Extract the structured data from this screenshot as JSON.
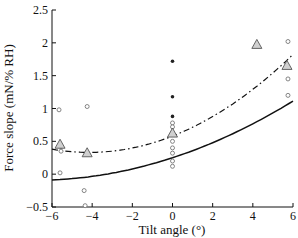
{
  "chart_data": {
    "type": "scatter",
    "title": "",
    "xlabel": "Tilt angle (°)",
    "ylabel": "Force slope (mN/% RH)",
    "xlim": [
      -6,
      6
    ],
    "ylim": [
      -0.5,
      2.5
    ],
    "xticks": [
      -6,
      -4,
      -2,
      0,
      2,
      4,
      6
    ],
    "xtick_labels": [
      "−6",
      "−4",
      "−2",
      "0",
      "2",
      "4",
      "6"
    ],
    "yticks": [
      -0.5,
      0,
      0.5,
      1,
      1.5,
      2,
      2.5
    ],
    "ytick_labels": [
      "−0.5",
      "0",
      "0.5",
      "1",
      "1.5",
      "2",
      "2.5"
    ],
    "grid": false,
    "legend": null,
    "series": [
      {
        "name": "Individual measurements (open circles)",
        "marker": "circle-open",
        "color": "#777777",
        "points": [
          [
            -5.65,
            0.98
          ],
          [
            -5.55,
            0.42
          ],
          [
            -5.55,
            0.35
          ],
          [
            -5.6,
            0.02
          ],
          [
            -4.25,
            1.03
          ],
          [
            -4.4,
            -0.25
          ],
          [
            -4.35,
            -0.48
          ],
          [
            0,
            0.78
          ],
          [
            0,
            0.72
          ],
          [
            0,
            0.62
          ],
          [
            0,
            0.5
          ],
          [
            0,
            0.4
          ],
          [
            0,
            0.32
          ],
          [
            0,
            0.2
          ],
          [
            0,
            0.12
          ],
          [
            5.75,
            2.02
          ],
          [
            5.75,
            1.45
          ],
          [
            5.75,
            1.2
          ]
        ]
      },
      {
        "name": "Individual measurements (filled dots)",
        "marker": "circle-filled",
        "color": "#222222",
        "points": [
          [
            0,
            1.72
          ],
          [
            0,
            1.18
          ],
          [
            0,
            0.88
          ]
        ]
      },
      {
        "name": "Means (triangles)",
        "marker": "triangle-open",
        "color": "#555555",
        "fill": "#d0d0d0",
        "points": [
          [
            -5.6,
            0.45
          ],
          [
            -4.25,
            0.32
          ],
          [
            0,
            0.62
          ],
          [
            4.2,
            1.97
          ],
          [
            5.7,
            1.65
          ]
        ]
      },
      {
        "name": "Fit (solid)",
        "line": "solid",
        "color": "#111111",
        "equation": "y = 0.25 + 0.10*x + 0.0073*x^2",
        "x": [
          -6,
          -5,
          -4,
          -3,
          -2,
          -1,
          0,
          1,
          2,
          3,
          4,
          5,
          6
        ],
        "values": [
          0.11,
          0.11,
          0.13,
          0.15,
          0.18,
          0.21,
          0.25,
          0.3,
          0.35,
          0.42,
          0.49,
          0.56,
          0.85
        ]
      },
      {
        "name": "Fit (dash-dot)",
        "line": "dash-dot",
        "color": "#111111",
        "equation": "y = 0.58 + 0.12*x + 0.0145*x^2",
        "x": [
          -6,
          -5,
          -4,
          -3,
          -2,
          -1,
          0,
          1,
          2,
          3,
          4,
          5,
          6
        ],
        "values": [
          0.11,
          0.16,
          0.23,
          0.32,
          0.44,
          0.53,
          0.6,
          0.7,
          0.83,
          0.95,
          1.08,
          1.25,
          1.45
        ]
      }
    ]
  }
}
